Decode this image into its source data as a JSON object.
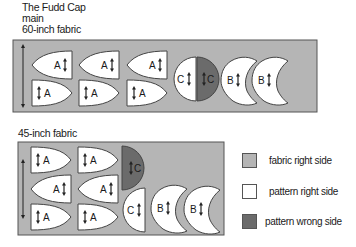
{
  "title": {
    "line1": "The Fudd Cap",
    "line2": "main",
    "line3": "60-inch fabric"
  },
  "layouts": [
    {
      "label": "60-inch fabric",
      "pieces": [
        "A",
        "A",
        "A",
        "A",
        "A",
        "A",
        "C",
        "C",
        "B",
        "B"
      ]
    },
    {
      "label": "45-inch fabric",
      "pieces": [
        "A",
        "A",
        "A",
        "A",
        "A",
        "A",
        "C",
        "C",
        "B",
        "B"
      ]
    }
  ],
  "lower_label": "45-inch fabric",
  "piece_labels": {
    "a": "A",
    "b": "B",
    "c": "C"
  },
  "legend": [
    {
      "label": "fabric right side",
      "color": "#b5b5b5"
    },
    {
      "label": "pattern right side",
      "color": "#ffffff"
    },
    {
      "label": "pattern wrong side",
      "color": "#6b6b6b"
    }
  ],
  "colors": {
    "fabric": "#b5b5b5",
    "pattern_right": "#ffffff",
    "pattern_wrong": "#6b6b6b",
    "outline": "#444444"
  }
}
